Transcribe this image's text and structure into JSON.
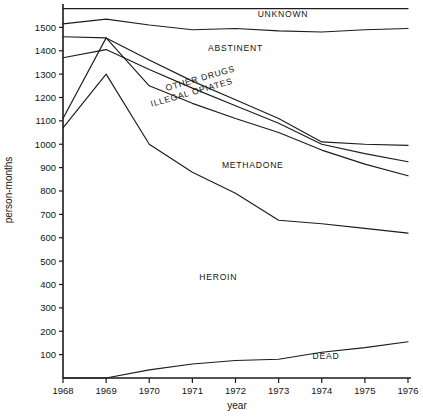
{
  "chart_data": {
    "type": "area",
    "title": "",
    "subtitle": "",
    "xlabel": "year",
    "ylabel": "person-months",
    "x": [
      1968,
      1969,
      1970,
      1971,
      1972,
      1973,
      1974,
      1975,
      1976
    ],
    "xlim": [
      1968,
      1976
    ],
    "ylim": [
      0,
      1600
    ],
    "y_ticks": [
      100,
      200,
      300,
      400,
      500,
      600,
      700,
      800,
      900,
      1000,
      1100,
      1200,
      1300,
      1400,
      1500
    ],
    "x_ticks": [
      1968,
      1969,
      1970,
      1971,
      1972,
      1973,
      1974,
      1975,
      1976
    ],
    "grid": false,
    "legend": "inline-band-labels",
    "stacking": "cumulative",
    "note": "Boundary curves are cumulative person-month totals; band between adjacent curves is each category.",
    "boundaries": [
      {
        "name": "total-top",
        "label": "",
        "values": [
          1580,
          1580,
          1580,
          1580,
          1580,
          1580,
          1580,
          1580,
          1580
        ]
      },
      {
        "name": "unknown-lower",
        "label": "UNKNOWN",
        "values": [
          1515,
          1535,
          1510,
          1490,
          1495,
          1485,
          1480,
          1490,
          1495
        ]
      },
      {
        "name": "abstinent-lower",
        "label": "ABSTINENT",
        "values": [
          1460,
          1455,
          1360,
          1270,
          1190,
          1110,
          1010,
          1000,
          995
        ]
      },
      {
        "name": "other-drugs-lower",
        "label": "OTHER DRUGS",
        "values": [
          1370,
          1405,
          1320,
          1240,
          1165,
          1090,
          1000,
          960,
          925
        ]
      },
      {
        "name": "illegal-opiates-lower",
        "label": "ILLEGAL OPIATES",
        "values": [
          1110,
          1455,
          1250,
          1175,
          1110,
          1050,
          975,
          915,
          865
        ]
      },
      {
        "name": "methadone-lower",
        "label": "METHADONE",
        "values": [
          1070,
          1300,
          1000,
          880,
          790,
          675,
          660,
          640,
          620
        ]
      },
      {
        "name": "heroin-lower",
        "label": "HEROIN",
        "values": [
          0,
          0,
          35,
          60,
          75,
          80,
          110,
          130,
          155
        ]
      }
    ],
    "band_labels": [
      {
        "text": "UNKNOWN",
        "x": 1973.1,
        "y": 1545,
        "rotate": 0
      },
      {
        "text": "ABSTINENT",
        "x": 1972.0,
        "y": 1400,
        "rotate": 0
      },
      {
        "text": "OTHER DRUGS",
        "x": 1971.2,
        "y": 1270,
        "rotate": -16
      },
      {
        "text": "ILLEGAL OPIATES",
        "x": 1971.0,
        "y": 1210,
        "rotate": -16
      },
      {
        "text": "METHADONE",
        "x": 1972.4,
        "y": 900,
        "rotate": 0
      },
      {
        "text": "HEROIN",
        "x": 1971.6,
        "y": 420,
        "rotate": 0
      },
      {
        "text": "DEAD",
        "x": 1974.1,
        "y": 80,
        "rotate": 0
      }
    ],
    "dead_label": "DEAD"
  }
}
